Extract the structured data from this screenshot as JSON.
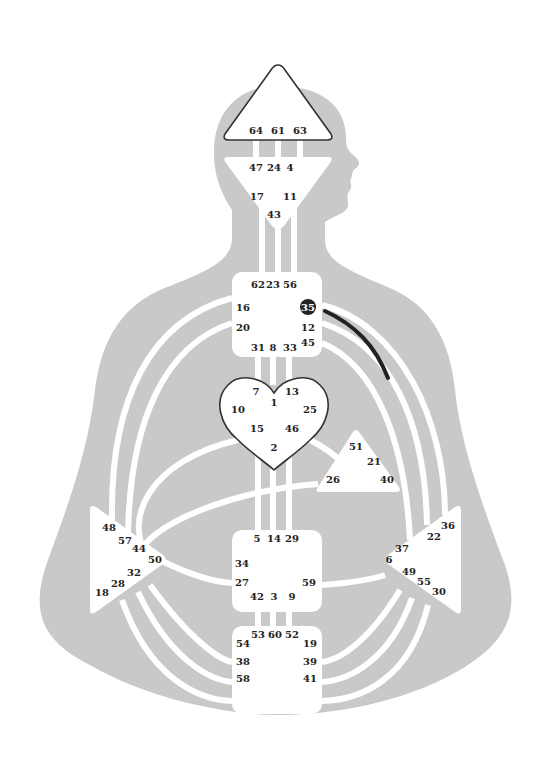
{
  "colors": {
    "background": "#ffffff",
    "silhouette": "#c9c9c9",
    "center_fill": "#ffffff",
    "outline_defined": "#333333",
    "active_gate_fill": "#222222",
    "active_channel": "#222222"
  },
  "centers": {
    "head": {
      "name": "Head",
      "defined": true,
      "gates": [
        "64",
        "61",
        "63"
      ]
    },
    "ajna": {
      "name": "Ajna",
      "defined": false,
      "gates": [
        "47",
        "24",
        "4",
        "17",
        "11",
        "43"
      ]
    },
    "throat": {
      "name": "Throat",
      "defined": false,
      "gates": [
        "62",
        "23",
        "56",
        "16",
        "35",
        "20",
        "12",
        "45",
        "31",
        "8",
        "33"
      ],
      "active_gates": [
        "35"
      ]
    },
    "g": {
      "name": "G",
      "defined": true,
      "gates": [
        "7",
        "1",
        "13",
        "10",
        "25",
        "15",
        "46",
        "2"
      ]
    },
    "heart": {
      "name": "Heart",
      "defined": false,
      "gates": [
        "51",
        "21",
        "26",
        "40"
      ]
    },
    "spleen": {
      "name": "Spleen",
      "defined": false,
      "gates": [
        "48",
        "57",
        "44",
        "50",
        "32",
        "28",
        "18"
      ]
    },
    "sacral": {
      "name": "Sacral",
      "defined": false,
      "gates": [
        "5",
        "14",
        "29",
        "34",
        "27",
        "59",
        "42",
        "3",
        "9"
      ]
    },
    "solar_plexus": {
      "name": "Solar Plexus",
      "defined": false,
      "gates": [
        "36",
        "22",
        "37",
        "6",
        "49",
        "55",
        "30"
      ]
    },
    "root": {
      "name": "Root",
      "defined": false,
      "gates": [
        "53",
        "60",
        "52",
        "54",
        "19",
        "38",
        "39",
        "58",
        "41"
      ]
    }
  },
  "active_channels": [
    {
      "gate": "35",
      "from": "throat",
      "toward": "solar_plexus",
      "type": "hanging-gate"
    }
  ],
  "labels": {
    "head": {
      "g64": "64",
      "g61": "61",
      "g63": "63"
    },
    "ajna": {
      "g47": "47",
      "g24": "24",
      "g4": "4",
      "g17": "17",
      "g11": "11",
      "g43": "43"
    },
    "throat": {
      "g62": "62",
      "g23": "23",
      "g56": "56",
      "g16": "16",
      "g35": "35",
      "g20": "20",
      "g12": "12",
      "g45": "45",
      "g31": "31",
      "g8": "8",
      "g33": "33"
    },
    "g": {
      "g7": "7",
      "g1": "1",
      "g13": "13",
      "g10": "10",
      "g25": "25",
      "g15": "15",
      "g46": "46",
      "g2": "2"
    },
    "heart": {
      "g51": "51",
      "g21": "21",
      "g26": "26",
      "g40": "40"
    },
    "spleen": {
      "g48": "48",
      "g57": "57",
      "g44": "44",
      "g50": "50",
      "g32": "32",
      "g28": "28",
      "g18": "18"
    },
    "sacral": {
      "g5": "5",
      "g14": "14",
      "g29": "29",
      "g34": "34",
      "g27": "27",
      "g59": "59",
      "g42": "42",
      "g3": "3",
      "g9": "9"
    },
    "solar": {
      "g36": "36",
      "g22": "22",
      "g37": "37",
      "g6": "6",
      "g49": "49",
      "g55": "55",
      "g30": "30"
    },
    "root": {
      "g53": "53",
      "g60": "60",
      "g52": "52",
      "g54": "54",
      "g19": "19",
      "g38": "38",
      "g39": "39",
      "g58": "58",
      "g41": "41"
    }
  }
}
